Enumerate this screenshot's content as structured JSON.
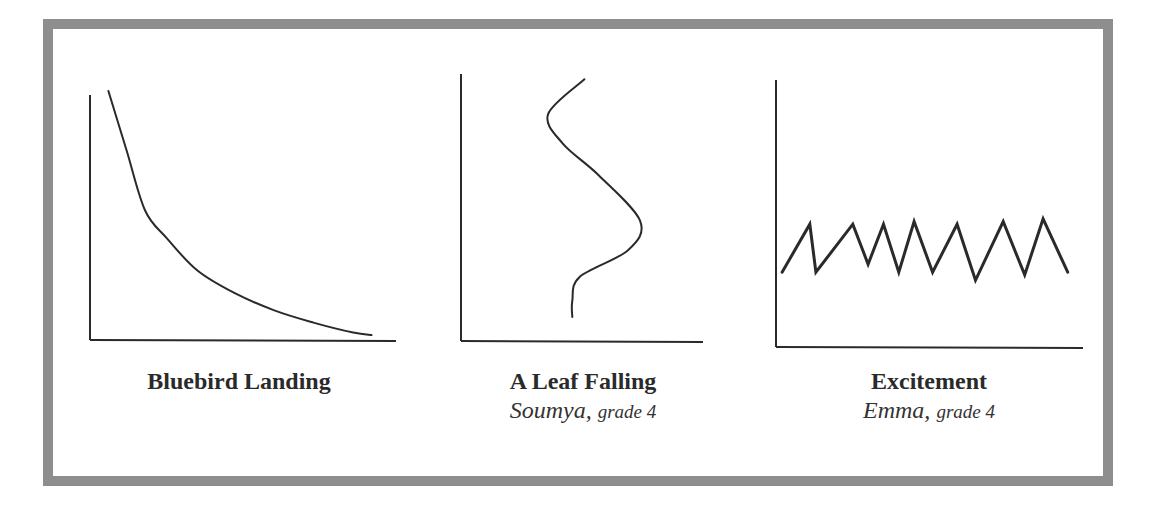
{
  "colors": {
    "frame_border": "#8e8e8e",
    "ink": "#2a2a2a",
    "background": "#ffffff"
  },
  "graphs": [
    {
      "title": "Bluebird Landing",
      "author": "",
      "grade": "",
      "shape": "decreasing curve (steep drop, then leveling off)"
    },
    {
      "title": "A Leaf Falling",
      "author": "Soumya,",
      "grade": "grade 4",
      "shape": "S-shaped wavy curve from top to bottom"
    },
    {
      "title": "Excitement",
      "author": "Emma,",
      "grade": "grade 4",
      "shape": "zigzag oscillating line"
    }
  ],
  "chart_data": [
    {
      "type": "line",
      "title": "Bluebird Landing",
      "xlabel": "",
      "ylabel": "",
      "grid": false,
      "xlim": [
        0,
        100
      ],
      "ylim": [
        0,
        100
      ],
      "series": [
        {
          "name": "curve",
          "x": [
            6,
            12,
            18,
            25,
            35,
            47,
            60,
            73,
            86,
            92
          ],
          "y": [
            100,
            76,
            52,
            41,
            28,
            19,
            12,
            7,
            3,
            2
          ]
        }
      ]
    },
    {
      "type": "line",
      "title": "A Leaf Falling",
      "subtitle": "Soumya, grade 4",
      "xlabel": "",
      "ylabel": "",
      "grid": false,
      "xlim": [
        0,
        100
      ],
      "ylim": [
        0,
        100
      ],
      "series": [
        {
          "name": "curve",
          "x": [
            51,
            36,
            42,
            57,
            74,
            69,
            49,
            46,
            46
          ],
          "y": [
            98,
            85,
            74,
            62,
            45,
            34,
            24,
            15,
            9
          ]
        }
      ]
    },
    {
      "type": "line",
      "title": "Excitement",
      "subtitle": "Emma, grade 4",
      "xlabel": "",
      "ylabel": "",
      "grid": false,
      "xlim": [
        0,
        100
      ],
      "ylim": [
        0,
        100
      ],
      "series": [
        {
          "name": "zigzag",
          "x": [
            2,
            11,
            13,
            25,
            30,
            35,
            40,
            45,
            51,
            59,
            65,
            74,
            81,
            87,
            95
          ],
          "y": [
            28,
            46,
            28,
            46,
            31,
            46,
            28,
            47,
            28,
            46,
            25,
            47,
            27,
            48,
            28
          ]
        }
      ]
    }
  ]
}
